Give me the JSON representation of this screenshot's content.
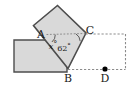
{
  "figure": {
    "type": "geometry-diagram",
    "colors": {
      "shape_fill": "#d9d9d9",
      "shape_stroke": "#4d4d4d",
      "dashed_stroke": "#8c8c8c",
      "label_color": "#1a1a1a",
      "point_color": "#000000",
      "background": "#ffffff"
    },
    "vertices": [
      {
        "name": "A",
        "label": "A",
        "x": 46.5,
        "y": 34.5,
        "label_x": 42.0,
        "label_y": 36.5
      },
      {
        "name": "C",
        "label": "C",
        "x": 85.0,
        "y": 33.5,
        "label_x": 87.0,
        "label_y": 33.5
      },
      {
        "name": "B",
        "label": "B",
        "x": 68.0,
        "y": 68.5,
        "label_x": 65.0,
        "label_y": 82.0
      },
      {
        "name": "D",
        "label": "D",
        "x": 105.0,
        "y": 69.0,
        "label_x": 102.0,
        "label_y": 82.0
      }
    ],
    "angles": [
      {
        "at": "A",
        "label": "x",
        "unit": "°",
        "label_x": 52.0,
        "label_y": 48.0,
        "is_variable": true
      },
      {
        "at": "C",
        "label": "62",
        "unit": "°",
        "label_x": 61.5,
        "label_y": 49.5,
        "is_variable": false
      }
    ],
    "shapes": {
      "rectangle_points": "14,40 67,40 67,72 14,72",
      "tilted_square_points": "33.5,25.5 57.5,5.5 86.0,33.0 68.0,68.5",
      "triangle_points": "46.5,34.5 85.0,33.5 68.0,68.5"
    },
    "dashed_paths": {
      "top_from_c": "M 85.5 34.0 L 125.5 34.0",
      "right_side": "M 125.5 34.0 L 125.5 69.5",
      "bottom_from_b": "M 68.0 69.5 L 125.5 69.5",
      "ac_segment": "M 46.5 34.5 L 85.0 33.5"
    },
    "point_marker": {
      "cx": 105.0,
      "cy": 69.0,
      "r": 2.6
    }
  }
}
